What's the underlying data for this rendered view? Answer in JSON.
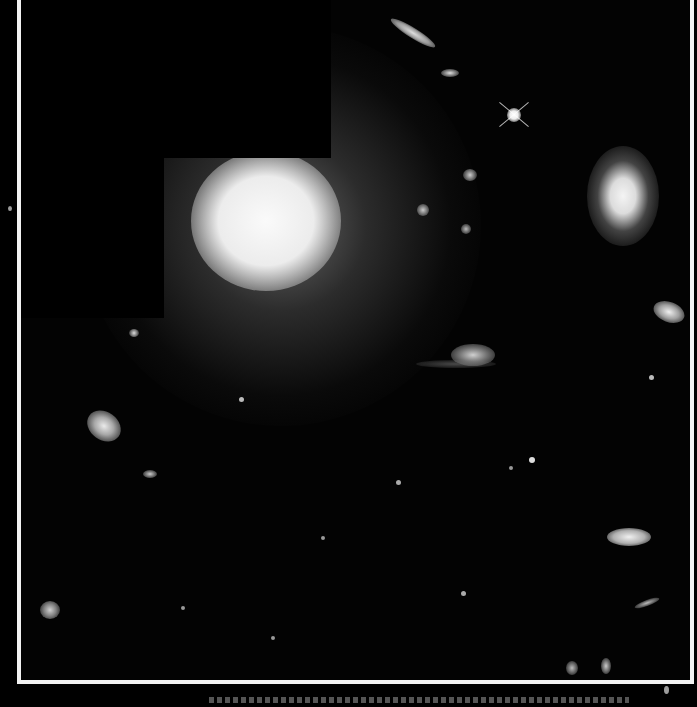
{
  "image": {
    "subject": "Hubble deep-field galaxy cluster image",
    "frame_color": "#f2f2f2",
    "background_color": "#030303"
  },
  "objects": [
    {
      "name": "giant-elliptical-galaxy",
      "x": 262,
      "y": 232,
      "rx": 80,
      "ry": 70,
      "color": "#f4f4f4"
    },
    {
      "name": "face-on-spiral-galaxy",
      "x": 622,
      "y": 202,
      "rx": 36,
      "ry": 50,
      "color": "#e8e8e8"
    },
    {
      "name": "bright-star",
      "x": 513,
      "y": 120,
      "r": 6,
      "color": "#ffffff"
    },
    {
      "name": "edge-on-galaxy-top",
      "x": 410,
      "y": 37,
      "rx": 26,
      "ry": 6,
      "color": "#cfcfcf"
    },
    {
      "name": "elliptical-galaxy-left",
      "x": 100,
      "y": 434,
      "rx": 18,
      "ry": 14,
      "color": "#d8d8d8"
    },
    {
      "name": "spiral-galaxy-lower-right",
      "x": 625,
      "y": 540,
      "rx": 22,
      "ry": 10,
      "color": "#e0e0e0"
    },
    {
      "name": "merging-galaxy-pair",
      "x": 472,
      "y": 360,
      "rx": 22,
      "ry": 12,
      "color": "#bdbdbd"
    },
    {
      "name": "galaxy-with-star-right",
      "x": 665,
      "y": 315,
      "rx": 16,
      "ry": 10,
      "color": "#dcdcdc"
    },
    {
      "name": "fuzzy-galaxy-lower-left",
      "x": 46,
      "y": 614,
      "rx": 10,
      "ry": 9,
      "color": "#bcbcbc"
    }
  ],
  "caption": {
    "text": "",
    "note": "caption text cut off at bottom edge"
  }
}
